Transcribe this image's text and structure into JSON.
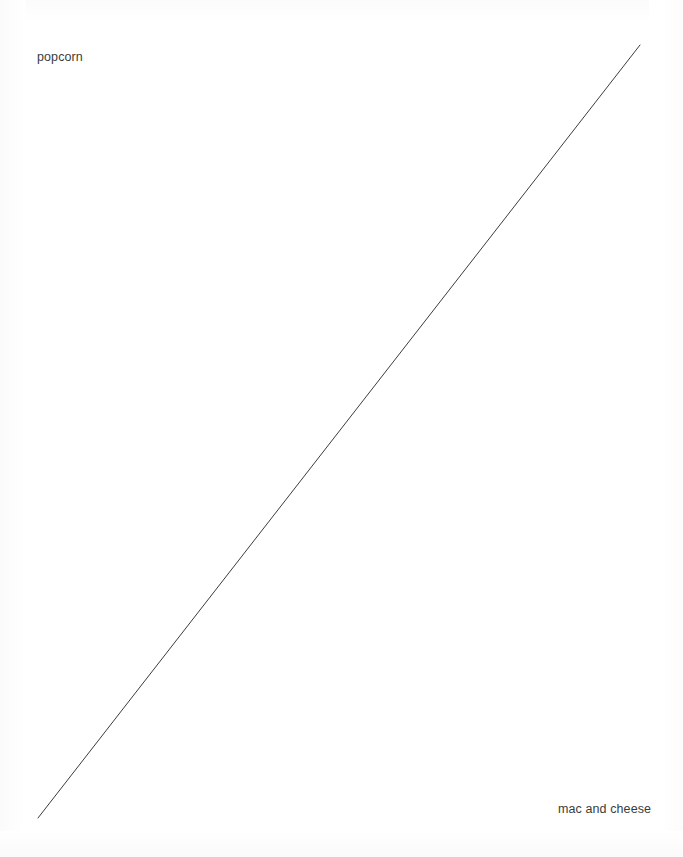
{
  "canvas": {
    "width": 683,
    "height": 857,
    "background_color": "#ffffff"
  },
  "labels": {
    "start": "popcorn",
    "end": "mac and cheese"
  },
  "chart_data": {
    "type": "line",
    "title": "",
    "subtitle": "",
    "xlabel": "",
    "ylabel": "",
    "grid": false,
    "axes_visible": false,
    "tick_labels": [],
    "legend_position": "none",
    "line_color": "#3c3c3e",
    "line_width": 1,
    "categories": [
      "popcorn",
      "mac and cheese"
    ],
    "x": [
      0,
      1
    ],
    "values": [
      0,
      1
    ],
    "series": [
      {
        "name": "preference",
        "x": [
          0,
          1
        ],
        "values": [
          0,
          1
        ]
      }
    ],
    "annotations": [
      {
        "text": "popcorn",
        "x": 0,
        "y": 0,
        "position": "top-left",
        "px": {
          "x": 37,
          "y": 62
        }
      },
      {
        "text": "mac and cheese",
        "x": 1,
        "y": 1,
        "position": "bottom-right",
        "px": {
          "x": 558,
          "y": 814
        }
      }
    ],
    "line_endpoints_px": {
      "x1": 38,
      "y1": 818,
      "x2": 640,
      "y2": 45
    },
    "xlim": [
      0,
      1
    ],
    "ylim": [
      0,
      1
    ]
  }
}
